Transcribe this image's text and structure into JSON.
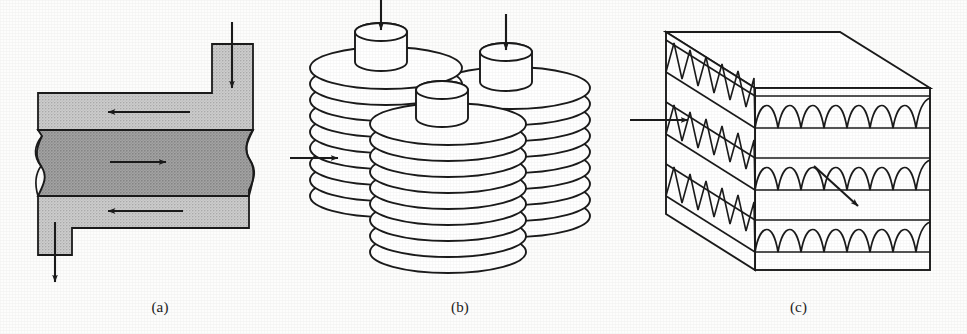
{
  "figure": {
    "type": "technical-line-diagram",
    "background_color": "#fdfdfc",
    "ink_color": "#1b1b1b"
  },
  "panels": [
    {
      "id": "a",
      "caption": "(a)",
      "name": "plate-fin-counterflow-channel",
      "style": "halftone-shaded-cross-section",
      "colors": {
        "outer_channel_fill": "#c8c8c8",
        "core_band_fill": "#a0a0a0",
        "outline": "#1b1b1b"
      },
      "flow_arrows": [
        {
          "name": "inlet-top-arrow",
          "direction": "down",
          "position": "top-right"
        },
        {
          "name": "upper-channel-arrow",
          "direction": "left",
          "position": "upper-band"
        },
        {
          "name": "core-band-arrow",
          "direction": "right",
          "position": "middle-band"
        },
        {
          "name": "lower-channel-arrow",
          "direction": "left",
          "position": "lower-band"
        },
        {
          "name": "outlet-bottom-arrow",
          "direction": "down",
          "position": "bottom-left"
        }
      ],
      "edge_features": {
        "left": "s-curve-lens-cutout",
        "right": "s-curve-lens-cutout"
      }
    },
    {
      "id": "b",
      "caption": "(b)",
      "name": "stacked-disc-plate-stacks",
      "style": "outline-isometric",
      "stack_count": 3,
      "discs_per_stack": 9,
      "hub_shape": "cylinder",
      "flow_arrows": [
        {
          "name": "hub-inlet-arrow-left",
          "direction": "down",
          "position": "left-stack-hub"
        },
        {
          "name": "hub-inlet-arrow-right",
          "direction": "down",
          "position": "right-stack-hub"
        },
        {
          "name": "side-inlet-arrow",
          "direction": "right",
          "position": "left-stack-side"
        }
      ]
    },
    {
      "id": "c",
      "caption": "(c)",
      "name": "corrugated-fin-block",
      "style": "outline-isometric-block",
      "fin_layers": 3,
      "fin_profile": "sinusoidal-corrugation",
      "front_cells_per_layer": 9,
      "side_cells_per_layer": 7,
      "flow_arrows": [
        {
          "name": "side-inlet-arrow",
          "direction": "right",
          "position": "left-face-middle-layer"
        },
        {
          "name": "front-flow-arrow",
          "direction": "down-right",
          "position": "front-face-middle-layer"
        }
      ]
    }
  ]
}
